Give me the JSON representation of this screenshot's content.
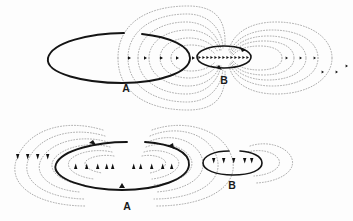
{
  "figure": {
    "background_color": "#fdfdfd",
    "loop_color": "#141414",
    "fieldline_color": "#8f8f8f",
    "marker_color": "#101010",
    "panels": [
      {
        "id": "top",
        "name": "parallel-currents-panel",
        "description": "Large loop A on the left and small loop B on the right, currents in the same sense; axial field markers point to the right.",
        "labels": [
          {
            "name": "label-a-top",
            "text": "A",
            "x": 126,
            "y": 89
          },
          {
            "name": "label-b-top",
            "text": "B",
            "x": 224,
            "y": 84
          }
        ],
        "loops": [
          {
            "name": "loop-a-top",
            "label": "A",
            "cx": 118,
            "cy": 58,
            "rx": 72,
            "ry": 25,
            "gap": true
          },
          {
            "name": "loop-b-top",
            "label": "B",
            "cx": 224,
            "cy": 57,
            "rx": 27,
            "ry": 11,
            "gap": false
          }
        ],
        "axis_marker_direction": "right",
        "axis_markers_left_count": 5,
        "axis_markers_inner_count": 13,
        "axis_markers_right_count": 6
      },
      {
        "id": "bottom",
        "name": "antiparallel-currents-panel",
        "description": "Large loop A on the left and small loop B on the right, currents in opposite senses; axial markers point up inside A and down inside B and far left.",
        "labels": [
          {
            "name": "label-a-bottom",
            "text": "A",
            "x": 127,
            "y": 207
          },
          {
            "name": "label-b-bottom",
            "text": "B",
            "x": 232,
            "y": 186
          }
        ],
        "loops": [
          {
            "name": "loop-a-bottom",
            "label": "A",
            "cx": 122,
            "cy": 166,
            "rx": 68,
            "ry": 24,
            "gap": true
          },
          {
            "name": "loop-b-bottom",
            "label": "B",
            "cx": 232,
            "cy": 163,
            "rx": 30,
            "ry": 12,
            "gap": true
          }
        ],
        "axis_marker_direction_left": "down",
        "axis_marker_direction_inner_a": "up",
        "axis_marker_direction_inner_b": "down",
        "axis_markers_far_left_count": 5,
        "axis_markers_inner_a_count": 8,
        "axis_markers_inner_b_count": 5
      }
    ]
  }
}
